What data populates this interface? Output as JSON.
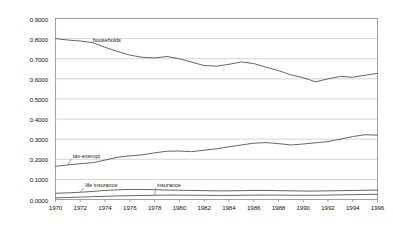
{
  "chart_data": {
    "type": "line",
    "title": "",
    "subtitle": "",
    "xlabel": "",
    "ylabel": "",
    "xlim": [
      1970,
      1996
    ],
    "ylim": [
      0.0,
      0.9
    ],
    "grid": "horizontal",
    "legend_position": "inline-annotations",
    "ytick_labels": [
      "0.0000",
      "0.1000",
      "0.2000",
      "0.3000",
      "0.4000",
      "0.5000",
      "0.6000",
      "0.7000",
      "0.8000",
      "0.9000"
    ],
    "ytick_values": [
      0.0,
      0.1,
      0.2,
      0.3,
      0.4,
      0.5,
      0.6,
      0.7,
      0.8,
      0.9
    ],
    "xtick_labels": [
      "1970",
      "1972",
      "1974",
      "1976",
      "1978",
      "1980",
      "1982",
      "1984",
      "1986",
      "1988",
      "1990",
      "1992",
      "1994",
      "1996"
    ],
    "xtick_values": [
      1970,
      1972,
      1974,
      1976,
      1978,
      1980,
      1982,
      1984,
      1986,
      1988,
      1990,
      1992,
      1994,
      1996
    ],
    "x": [
      1970,
      1971,
      1972,
      1973,
      1974,
      1975,
      1976,
      1977,
      1978,
      1979,
      1980,
      1981,
      1982,
      1983,
      1984,
      1985,
      1986,
      1987,
      1988,
      1989,
      1990,
      1991,
      1992,
      1993,
      1994,
      1995,
      1996
    ],
    "series": [
      {
        "name": "households",
        "color": "#555555",
        "values": [
          0.8,
          0.793,
          0.788,
          0.78,
          0.757,
          0.736,
          0.718,
          0.707,
          0.704,
          0.711,
          0.7,
          0.683,
          0.666,
          0.663,
          0.672,
          0.684,
          0.676,
          0.658,
          0.641,
          0.62,
          0.606,
          0.585,
          0.6,
          0.612,
          0.608,
          0.618,
          0.627
        ],
        "annotation": {
          "label": "households",
          "x": 1973.0,
          "y": 0.79
        }
      },
      {
        "name": "tax-exempt",
        "color": "#555555",
        "values": [
          0.165,
          0.172,
          0.178,
          0.183,
          0.196,
          0.21,
          0.217,
          0.222,
          0.232,
          0.24,
          0.241,
          0.238,
          0.245,
          0.252,
          0.262,
          0.271,
          0.28,
          0.283,
          0.278,
          0.271,
          0.276,
          0.282,
          0.288,
          0.3,
          0.313,
          0.322,
          0.32
        ],
        "annotation": {
          "label": "tax-exempt",
          "x": 1971.4,
          "y": 0.21
        }
      },
      {
        "name": "life insurance",
        "color": "#555555",
        "values": [
          0.031,
          0.033,
          0.036,
          0.04,
          0.045,
          0.048,
          0.05,
          0.05,
          0.049,
          0.047,
          0.046,
          0.045,
          0.044,
          0.043,
          0.043,
          0.044,
          0.045,
          0.045,
          0.044,
          0.043,
          0.042,
          0.042,
          0.043,
          0.044,
          0.045,
          0.046,
          0.047
        ],
        "annotation": {
          "label": "life insurance",
          "x": 1972.4,
          "y": 0.066
        }
      },
      {
        "name": "insurance",
        "color": "#555555",
        "values": [
          0.008,
          0.01,
          0.012,
          0.014,
          0.016,
          0.018,
          0.019,
          0.02,
          0.021,
          0.022,
          0.022,
          0.021,
          0.021,
          0.02,
          0.02,
          0.021,
          0.022,
          0.022,
          0.022,
          0.021,
          0.021,
          0.021,
          0.022,
          0.023,
          0.024,
          0.025,
          0.026
        ],
        "annotation": {
          "label": "insurance",
          "x": 1978.2,
          "y": 0.066
        }
      }
    ]
  },
  "style": {
    "axis_color": "#8c8c8c",
    "grid_color": "#b5b5b5",
    "line_color": "#555555",
    "text_color": "#111111",
    "background": "#ffffff"
  }
}
